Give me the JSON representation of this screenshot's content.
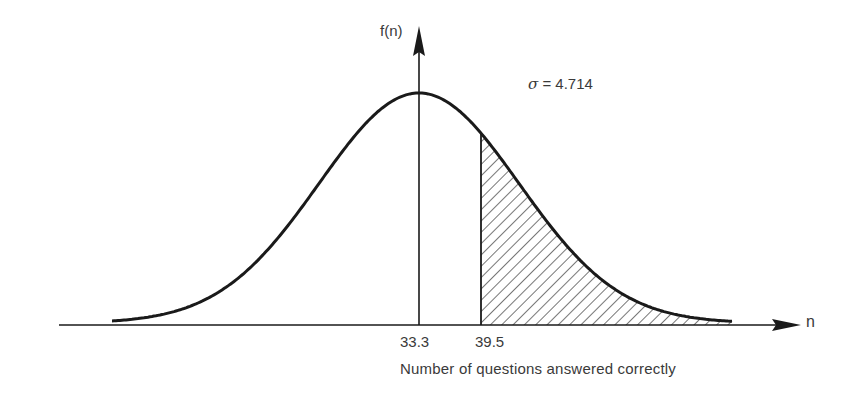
{
  "chart_data": {
    "type": "area",
    "title": "",
    "xlabel": "Number of questions answered correctly",
    "ylabel": "f(n)",
    "x_axis_symbol": "n",
    "mean": 33.3,
    "sigma": 4.714,
    "sigma_label": "= 4.714",
    "sigma_symbol": "σ",
    "ticks": [
      {
        "value": 33.3,
        "label": "33.3"
      },
      {
        "value": 39.5,
        "label": "39.5"
      }
    ],
    "shaded_region": {
      "from": 39.5,
      "to": "right tail",
      "pattern": "diagonal hatch"
    },
    "grid": false,
    "legend": null
  },
  "colors": {
    "ink": "#1a1a1a",
    "text": "#3a3a3a",
    "background": "#ffffff"
  }
}
